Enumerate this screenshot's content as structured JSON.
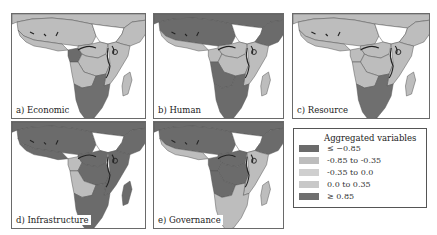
{
  "colors": {
    "very_low": "#6b6b6b",
    "low": "#bdbdbd",
    "mid": "#cfcfcf",
    "high": "#c8c8c8",
    "very_high": "#6f6f6f",
    "no_data": "#ffffff",
    "border": "#555555",
    "water": "#222222"
  },
  "panels": [
    {
      "id": "a",
      "label": "a) Economic",
      "regions": {
        "north": "low",
        "sahel": "low",
        "westcoast": "low",
        "sudan": "no_data",
        "horn": "low",
        "gabon": "very_low",
        "congo": "low",
        "angola": "low",
        "east": "low",
        "south": "very_high",
        "madagascar": "low",
        "drc": "low"
      }
    },
    {
      "id": "b",
      "label": "b) Human",
      "regions": {
        "north": "very_low",
        "sahel": "very_low",
        "westcoast": "low",
        "sudan": "no_data",
        "horn": "very_low",
        "gabon": "low",
        "congo": "low",
        "angola": "very_low",
        "east": "low",
        "south": "very_low",
        "madagascar": "low",
        "drc": "low"
      }
    },
    {
      "id": "c",
      "label": "c) Resource",
      "regions": {
        "north": "low",
        "sahel": "low",
        "westcoast": "low",
        "sudan": "no_data",
        "horn": "low",
        "gabon": "low",
        "congo": "low",
        "angola": "low",
        "east": "low",
        "south": "very_high",
        "madagascar": "low",
        "drc": "low"
      }
    },
    {
      "id": "d",
      "label": "d) Infrastructure",
      "regions": {
        "north": "very_low",
        "sahel": "very_low",
        "westcoast": "very_low",
        "sudan": "no_data",
        "horn": "very_low",
        "gabon": "low",
        "congo": "very_low",
        "angola": "low",
        "east": "very_low",
        "south": "very_low",
        "madagascar": "very_low",
        "drc": "very_low"
      }
    },
    {
      "id": "e",
      "label": "e) Governance",
      "regions": {
        "north": "very_low",
        "sahel": "very_low",
        "westcoast": "low",
        "sudan": "no_data",
        "horn": "very_low",
        "gabon": "very_low",
        "congo": "very_low",
        "angola": "very_low",
        "east": "low",
        "south": "low",
        "madagascar": "low",
        "drc": "very_low"
      }
    }
  ],
  "legend": {
    "title": "Aggregated variables",
    "items": [
      {
        "key": "very_low",
        "label": "≤  −0.85"
      },
      {
        "key": "low",
        "label": "-0.85 to -0.35"
      },
      {
        "key": "mid",
        "label": "-0.35 to 0.0"
      },
      {
        "key": "high",
        "label": "0.0 to 0.35"
      },
      {
        "key": "very_high",
        "label": "≥  0.85"
      }
    ]
  }
}
